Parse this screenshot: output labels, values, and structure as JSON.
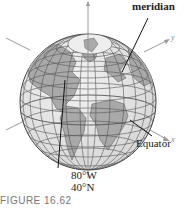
{
  "figure": {
    "caption": "FIGURE 16.62",
    "labels": {
      "meridian": "meridian",
      "equator": "Equator",
      "longitude": "80°W",
      "latitude": "40°N"
    },
    "axes": {
      "x": "x",
      "y": "y",
      "z": ""
    },
    "colors": {
      "ocean": "#e8e8e8",
      "land": "#a9a9a9",
      "grid": "#555555",
      "axis": "#999999"
    }
  }
}
